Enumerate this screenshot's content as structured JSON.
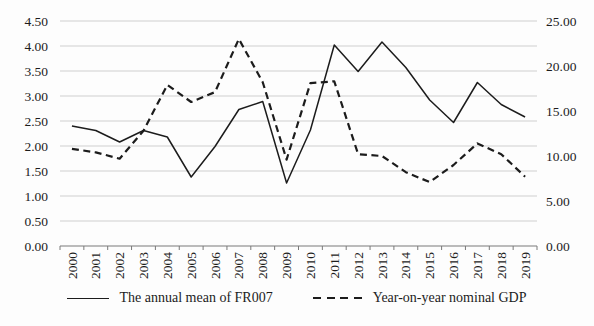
{
  "chart_data": {
    "type": "line",
    "x": [
      "2000",
      "2001",
      "2002",
      "2003",
      "2004",
      "2005",
      "2006",
      "2007",
      "2008",
      "2009",
      "2010",
      "2011",
      "2012",
      "2013",
      "2014",
      "2015",
      "2016",
      "2017",
      "2018",
      "2019"
    ],
    "series": [
      {
        "name": "The annual mean of FR007",
        "axis": "left",
        "line_style": "solid",
        "values": [
          2.4,
          2.31,
          2.08,
          2.31,
          2.18,
          1.38,
          1.99,
          2.73,
          2.89,
          1.26,
          2.32,
          4.02,
          3.49,
          4.08,
          3.57,
          2.92,
          2.47,
          3.27,
          2.83,
          2.58
        ]
      },
      {
        "name": "Year-on-year nominal GDP",
        "axis": "right",
        "line_style": "dashed",
        "values": [
          10.8,
          10.4,
          9.7,
          12.8,
          17.9,
          16.0,
          17.1,
          23.0,
          18.2,
          9.6,
          18.1,
          18.3,
          10.2,
          10.0,
          8.2,
          7.1,
          9.0,
          11.4,
          10.2,
          7.7
        ]
      }
    ],
    "left_axis": {
      "min": 0,
      "max": 4.5,
      "step": 0.5,
      "tick_labels": [
        "0.00",
        "0.50",
        "1.00",
        "1.50",
        "2.00",
        "2.50",
        "3.00",
        "3.50",
        "4.00",
        "4.50"
      ]
    },
    "right_axis": {
      "min": 0,
      "max": 25.0,
      "step": 5.0,
      "tick_labels": [
        "0.00",
        "5.00",
        "10.00",
        "15.00",
        "20.00",
        "25.00"
      ]
    },
    "grid": true,
    "legend_position": "bottom"
  },
  "colors": {
    "line": "#1c1c1c",
    "grid": "#cfcfcf",
    "axis": "#7a7a7a",
    "text": "#1c1c1c",
    "background": "#fdfdfd"
  }
}
